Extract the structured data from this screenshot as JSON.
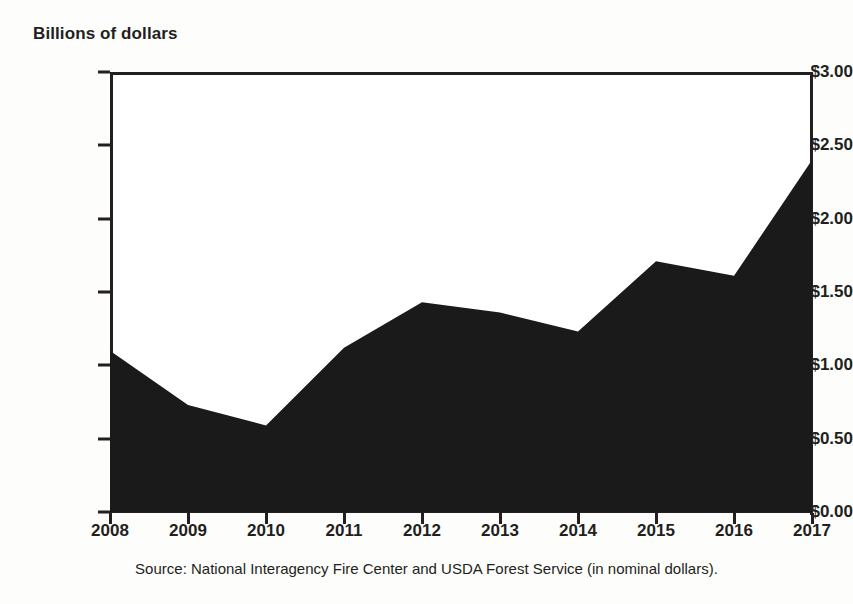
{
  "chart_data": {
    "type": "area",
    "title": "",
    "ylabel": "Billions of dollars",
    "xlabel": "",
    "categories": [
      "2008",
      "2009",
      "2010",
      "2011",
      "2012",
      "2013",
      "2014",
      "2015",
      "2016",
      "2017"
    ],
    "values": [
      1.1,
      0.73,
      0.59,
      1.12,
      1.43,
      1.36,
      1.23,
      1.71,
      1.61,
      2.4
    ],
    "series": [
      {
        "name": "Federal wildfire suppression spending",
        "values": [
          1.1,
          0.73,
          0.59,
          1.12,
          1.43,
          1.36,
          1.23,
          1.71,
          1.61,
          2.4
        ]
      }
    ],
    "ylim": [
      0,
      3
    ],
    "ytick_values": [
      0,
      0.5,
      1.0,
      1.5,
      2.0,
      2.5,
      3.0
    ],
    "ytick_labels": [
      "$0.00",
      "$0.50",
      "$1.00",
      "$1.50",
      "$2.00",
      "$2.50",
      "$3.00"
    ],
    "xtick_labels": [
      "2008",
      "2009",
      "2010",
      "2011",
      "2012",
      "2013",
      "2014",
      "2015",
      "2016",
      "2017"
    ],
    "grid": false,
    "legend": "none",
    "fill_color": "#1a1a1a",
    "axis_color": "#231f20",
    "background_color": "#ffffff"
  },
  "axis": {
    "unit_title": "Billions of dollars"
  },
  "source": {
    "note": "Source: National Interagency Fire Center and USDA Forest Service (in nominal dollars)."
  }
}
